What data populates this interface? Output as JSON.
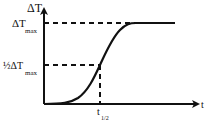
{
  "diagram": {
    "y_axis_label": "ΔT",
    "x_axis_label": "t",
    "max_label_main": "ΔT",
    "max_label_sub": "max",
    "half_label_main": "½ΔT",
    "half_label_sub": "max",
    "t_half_main": "t",
    "t_half_sub": "1/2",
    "curve_type": "sigmoid",
    "colors": {
      "line": "#111111",
      "background": "#ffffff"
    }
  }
}
